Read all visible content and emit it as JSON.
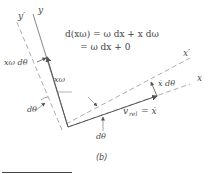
{
  "figure": {
    "caption": "(b)",
    "axes": {
      "y_label": "y",
      "y_prime_label": "y′",
      "x_label": "x",
      "x_prime_label": "x′"
    },
    "vectors": {
      "x_omega": "xω",
      "v_rel": "v",
      "v_rel_sub": "rel",
      "v_rel_rhs": "= ẋ"
    },
    "increments": {
      "x_omega_dtheta": "xω dθ",
      "xdot_dtheta": "ẋ dθ"
    },
    "angles": {
      "dtheta_left": "dθ",
      "dtheta_bottom": "dθ"
    },
    "equation": {
      "line1": "d(xω) = ω dx + x dω",
      "line2": "= ω dx + 0"
    },
    "colors": {
      "line": "#555555",
      "dashed": "#777777",
      "text": "#444444"
    }
  }
}
